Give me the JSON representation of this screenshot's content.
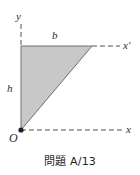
{
  "figure": {
    "caption": "問題 A/13",
    "background_color": "#ffffff",
    "shape": {
      "name": "right-triangle",
      "fill_color": "#c8c8c8",
      "stroke_color": "#6e6e6e",
      "vertices": [
        {
          "name": "top-left",
          "x": 21,
          "y": 46
        },
        {
          "name": "top-right",
          "x": 92,
          "y": 46
        },
        {
          "name": "origin",
          "x": 21,
          "y": 130
        }
      ]
    },
    "labels": {
      "y_axis": "y",
      "base": "b",
      "height": "h",
      "origin": "O",
      "x_prime_axis": "x'",
      "x_axis": "x"
    },
    "axes": [
      {
        "name": "y-axis",
        "style": "dashed",
        "from": {
          "x": 21,
          "y": 24
        },
        "to": {
          "x": 21,
          "y": 46
        }
      },
      {
        "name": "x-prime-axis",
        "style": "dashed",
        "from": {
          "x": 92,
          "y": 46
        },
        "to": {
          "x": 120,
          "y": 46
        }
      },
      {
        "name": "x-axis",
        "style": "dashed",
        "from": {
          "x": 21,
          "y": 130
        },
        "to": {
          "x": 122,
          "y": 130
        }
      }
    ],
    "origin_marker": {
      "x": 21,
      "y": 130,
      "radius": 2.6,
      "color": "#1f1f1f"
    }
  }
}
